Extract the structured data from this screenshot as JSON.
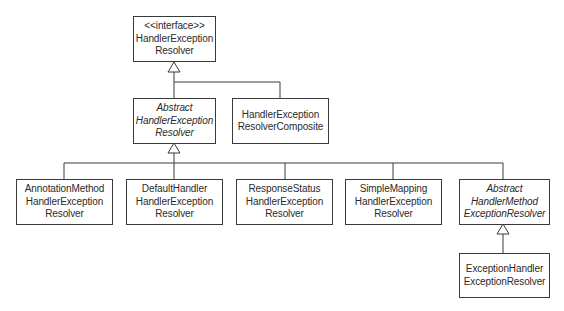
{
  "diagram": {
    "type": "uml-class-hierarchy",
    "nodes": {
      "handler_exception_resolver": {
        "stereotype": "<<interface>>",
        "line1": "HandlerException",
        "line2": "Resolver",
        "kind": "interface"
      },
      "abstract_handler_exception_resolver": {
        "line1": "Abstract",
        "line2": "HandlerException",
        "line3": "Resolver",
        "kind": "abstract"
      },
      "handler_exception_resolver_composite": {
        "line1": "HandlerException",
        "line2": "ResolverComposite",
        "kind": "class"
      },
      "annotation_method_handler_exception_resolver": {
        "line1": "AnnotationMethod",
        "line2": "HandlerException",
        "line3": "Resolver",
        "kind": "class"
      },
      "default_handler_exception_resolver": {
        "line1": "DefaultHandler",
        "line2": "HandlerException",
        "line3": "Resolver",
        "kind": "class"
      },
      "response_status_handler_exception_resolver": {
        "line1": "ResponseStatus",
        "line2": "HandlerException",
        "line3": "Resolver",
        "kind": "class"
      },
      "simple_mapping_handler_exception_resolver": {
        "line1": "SimpleMapping",
        "line2": "HandlerException",
        "line3": "Resolver",
        "kind": "class"
      },
      "abstract_handler_method_exception_resolver": {
        "line1": "Abstract",
        "line2": "HandlerMethod",
        "line3": "ExceptionResolver",
        "kind": "abstract"
      },
      "exception_handler_exception_resolver": {
        "line1": "ExceptionHandler",
        "line2": "ExceptionResolver",
        "kind": "class"
      }
    },
    "edges": [
      {
        "from": "abstract_handler_exception_resolver",
        "to": "handler_exception_resolver",
        "type": "realization"
      },
      {
        "from": "handler_exception_resolver_composite",
        "to": "handler_exception_resolver",
        "type": "realization"
      },
      {
        "from": "annotation_method_handler_exception_resolver",
        "to": "abstract_handler_exception_resolver",
        "type": "generalization"
      },
      {
        "from": "default_handler_exception_resolver",
        "to": "abstract_handler_exception_resolver",
        "type": "generalization"
      },
      {
        "from": "response_status_handler_exception_resolver",
        "to": "abstract_handler_exception_resolver",
        "type": "generalization"
      },
      {
        "from": "simple_mapping_handler_exception_resolver",
        "to": "abstract_handler_exception_resolver",
        "type": "generalization"
      },
      {
        "from": "abstract_handler_method_exception_resolver",
        "to": "abstract_handler_exception_resolver",
        "type": "generalization"
      },
      {
        "from": "exception_handler_exception_resolver",
        "to": "abstract_handler_method_exception_resolver",
        "type": "generalization"
      }
    ],
    "colors": {
      "line": "#3a3a3a",
      "text": "#2a2a2a",
      "background": "#ffffff"
    }
  }
}
